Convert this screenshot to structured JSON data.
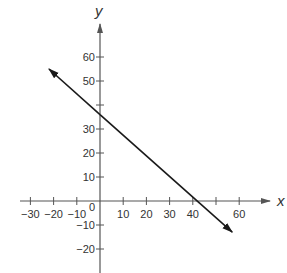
{
  "chart_data": {
    "type": "line",
    "title": "",
    "xlabel": "x",
    "ylabel": "y",
    "xlim": [
      -35,
      75
    ],
    "ylim": [
      -30,
      73
    ],
    "grid": false,
    "x_ticks": [
      -30,
      -20,
      -10,
      0,
      10,
      20,
      30,
      40,
      50,
      60
    ],
    "x_tick_labels": [
      "−30",
      "−20",
      "−10",
      "0",
      "10",
      "20",
      "30",
      "40",
      "",
      "60"
    ],
    "y_ticks": [
      -20,
      -10,
      10,
      20,
      30,
      40,
      50,
      60
    ],
    "y_tick_labels": [
      "−20",
      "−10",
      "10",
      "20",
      "30",
      "",
      "50",
      "60"
    ],
    "series": [
      {
        "name": "line",
        "equation": "y = -(6/7)x + 36",
        "x": [
          -22,
          0,
          42,
          57
        ],
        "y": [
          55,
          36,
          0,
          -13
        ],
        "arrows": "both",
        "color": "#1a1a1a"
      }
    ],
    "annotations": {
      "y_intercept": 36,
      "x_intercept": 42
    }
  },
  "colors": {
    "axis": "#555555",
    "line": "#1a1a1a",
    "text": "#333333"
  }
}
